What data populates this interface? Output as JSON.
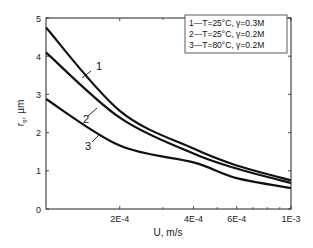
{
  "chart_data": {
    "type": "line",
    "title": "",
    "xlabel": "U, m/s",
    "ylabel": "r_s, µm",
    "ylabel_main": "r",
    "ylabel_sub": "s",
    "ylabel_unit": ", µm",
    "xscale": "log",
    "xlim": [
      0.0001,
      0.001
    ],
    "ylim": [
      0,
      5
    ],
    "grid": false,
    "x_ticks": [
      {
        "value": 0.0002,
        "label": "2E-4"
      },
      {
        "value": 0.0004,
        "label": "4E-4"
      },
      {
        "value": 0.0006,
        "label": "6E-4"
      },
      {
        "value": 0.001,
        "label": "1E-3"
      }
    ],
    "x_minor_ticks": [
      0.0003,
      0.0005,
      0.0007,
      0.0008,
      0.0009
    ],
    "y_ticks": [
      0,
      1,
      2,
      3,
      4,
      5
    ],
    "legend_position": "upper right",
    "legend": [
      "1—T=25°C, γ=0.3M",
      "2—T=25°C, γ=0.2M",
      "3—T=80°C, γ=0.2M"
    ],
    "x": [
      0.0001,
      0.0002,
      0.0004,
      0.0006,
      0.001
    ],
    "series": [
      {
        "name": "1",
        "label": "T=25°C, γ=0.3M",
        "values": [
          4.75,
          2.57,
          1.58,
          1.14,
          0.75
        ]
      },
      {
        "name": "2",
        "label": "T=25°C, γ=0.2M",
        "values": [
          4.1,
          2.39,
          1.45,
          1.06,
          0.68
        ]
      },
      {
        "name": "3",
        "label": "T=80°C, γ=0.2M",
        "values": [
          2.88,
          1.66,
          1.22,
          0.81,
          0.55
        ]
      }
    ],
    "annotations": [
      {
        "text": "1",
        "x": 96,
        "y": 70,
        "leader": [
          82,
          78,
          91,
          71
        ]
      },
      {
        "text": "2",
        "x": 83,
        "y": 123,
        "leader": [
          88,
          116,
          97,
          108
        ]
      },
      {
        "text": "3",
        "x": 85,
        "y": 150,
        "leader": [
          92,
          142,
          100,
          134
        ]
      }
    ]
  }
}
